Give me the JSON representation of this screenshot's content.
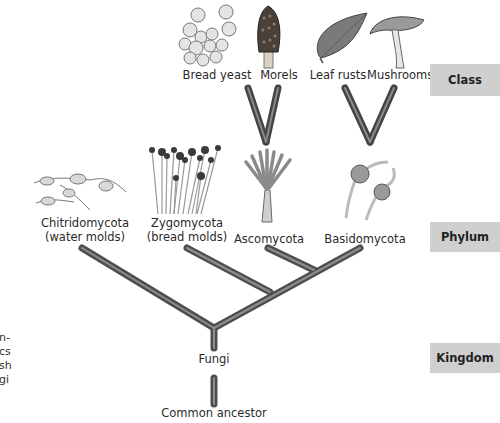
{
  "ranks": {
    "class": "Class",
    "phylum": "Phylum",
    "kingdom": "Kingdom"
  },
  "classes": [
    {
      "label": "Bread yeast",
      "icon": "bread-yeast-illustration"
    },
    {
      "label": "Morels",
      "icon": "morel-illustration"
    },
    {
      "label": "Leaf rusts",
      "icon": "leaf-rust-illustration"
    },
    {
      "label": "Mushrooms",
      "icon": "mushroom-illustration"
    }
  ],
  "phyla": [
    {
      "line1": "Chitridomycota",
      "line2": "(water molds)",
      "icon": "chitrid-illustration"
    },
    {
      "line1": "Zygomycota",
      "line2": "(bread molds)",
      "icon": "zygomycete-illustration"
    },
    {
      "line1": "Ascomycota",
      "line2": "",
      "icon": "ascomycete-illustration"
    },
    {
      "line1": "Basidomycota",
      "line2": "",
      "icon": "basidiomycete-illustration"
    }
  ],
  "kingdom_label": "Fungi",
  "root_label": "Common ancestor",
  "cropped_caption": [
    "n-",
    "cs",
    "sh",
    "gi"
  ],
  "colors": {
    "branch": "#5a5a5a",
    "branch_highlight": "#8a8a8a",
    "rank_box": "#cfcfcf"
  }
}
